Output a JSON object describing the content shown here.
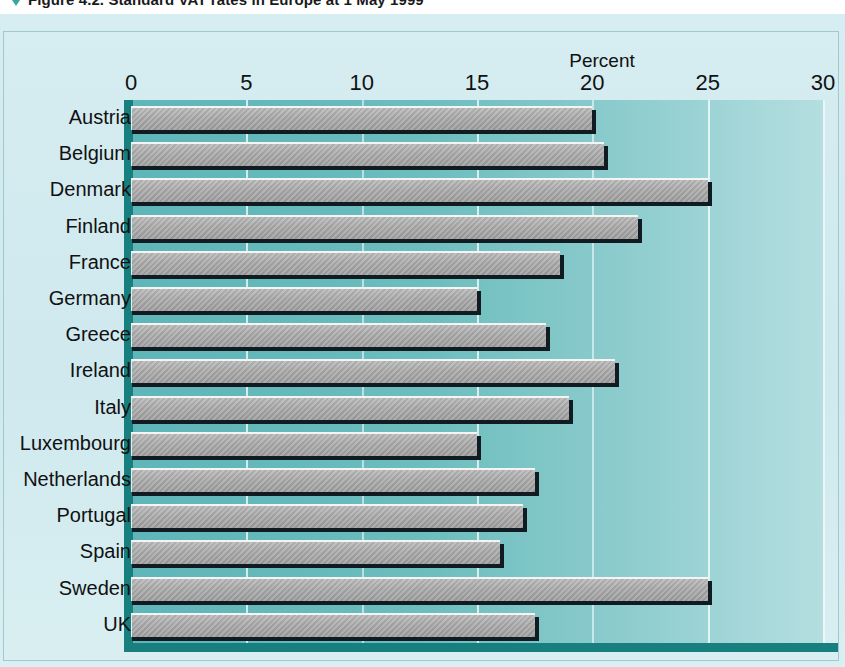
{
  "figure": {
    "marker": "triangle-down-marker",
    "caption": "Figure 4.2.  Standard VAT rates in Europe at 1 May 1999"
  },
  "chart_data": {
    "type": "bar",
    "orientation": "horizontal",
    "title": "",
    "xlabel": "Percent",
    "ylabel": "",
    "xlim": [
      0,
      30
    ],
    "xticks": [
      0,
      5,
      10,
      15,
      20,
      25,
      30
    ],
    "xtick_labels": [
      "0",
      "5",
      "10",
      "15",
      "20",
      "25",
      "30"
    ],
    "grid": true,
    "legend": "none",
    "categories": [
      "Austria",
      "Belgium",
      "Denmark",
      "Finland",
      "France",
      "Germany",
      "Greece",
      "Ireland",
      "Italy",
      "Luxembourg",
      "Netherlands",
      "Portugal",
      "Spain",
      "Sweden",
      "UK"
    ],
    "values": [
      20.0,
      20.5,
      25.0,
      22.0,
      18.6,
      15.0,
      18.0,
      21.0,
      19.0,
      15.0,
      17.5,
      17.0,
      16.0,
      25.0,
      17.5
    ],
    "bars": [
      {
        "label": "Austria",
        "value": 20.0
      },
      {
        "label": "Belgium",
        "value": 20.5
      },
      {
        "label": "Denmark",
        "value": 25.0
      },
      {
        "label": "Finland",
        "value": 22.0
      },
      {
        "label": "France",
        "value": 18.6
      },
      {
        "label": "Germany",
        "value": 15.0
      },
      {
        "label": "Greece",
        "value": 18.0
      },
      {
        "label": "Ireland",
        "value": 21.0
      },
      {
        "label": "Italy",
        "value": 19.0
      },
      {
        "label": "Luxembourg",
        "value": 15.0
      },
      {
        "label": "Netherlands",
        "value": 17.5
      },
      {
        "label": "Portugal",
        "value": 17.0
      },
      {
        "label": "Spain",
        "value": 16.0
      },
      {
        "label": "Sweden",
        "value": 25.0
      },
      {
        "label": "UK",
        "value": 17.5
      }
    ],
    "colors": {
      "bar_fill": "#a9a9a9",
      "bar_highlight": "#f4f4f4",
      "bar_shadow": "#101b22",
      "plot_background_left": "#5fb6b8",
      "plot_background_right": "#b4dee0",
      "panel_background": "#d4ecf0",
      "axis_line": "#17807f",
      "gridline": "#ffffff",
      "text": "#111111"
    }
  }
}
